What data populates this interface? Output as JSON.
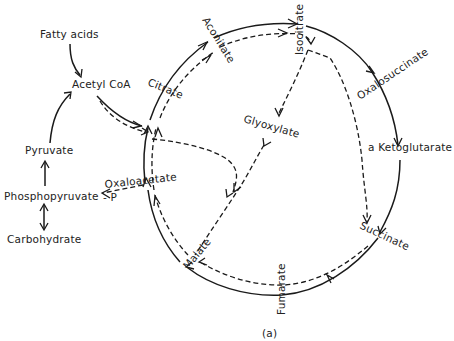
{
  "diagram": {
    "type": "metabolic-pathway",
    "caption": "(a)",
    "labels": {
      "fatty_acids": "Fatty acids",
      "acetyl_coa": "Acetyl CoA",
      "pyruvate": "Pyruvate",
      "phosphopyruvate": "Phosphopyruvate",
      "carbohydrate": "Carbohydrate",
      "oxaloacetate": "Oxaloacetate",
      "minus_p": "- P",
      "citrate": "Citrate",
      "aconitate": "Aconitate",
      "isocitrate": "Isocitrate",
      "oxalosuccinate": "Oxalosuccinate",
      "ketoglutarate": "a Ketoglutarate",
      "succinate": "Succinate",
      "fumarate": "Fumarate",
      "malate": "Malate",
      "glyoxylate": "Glyoxylate"
    },
    "pathways": {
      "solid": "Tricarboxylic acid (Krebs) cycle",
      "dashed": "Glyoxylate cycle"
    },
    "edges": [
      {
        "from": "Fatty acids",
        "to": "Acetyl CoA",
        "style": "solid"
      },
      {
        "from": "Pyruvate",
        "to": "Acetyl CoA",
        "style": "solid"
      },
      {
        "from": "Phosphopyruvate",
        "to": "Pyruvate",
        "style": "solid"
      },
      {
        "from": "Phosphopyruvate",
        "to": "Carbohydrate",
        "style": "solid",
        "bidirectional": true
      },
      {
        "from": "Acetyl CoA",
        "to": "Citrate",
        "style": "solid"
      },
      {
        "from": "Acetyl CoA",
        "to": "Citrate",
        "style": "dashed"
      },
      {
        "from": "Acetyl CoA",
        "to": "Malate",
        "style": "dashed"
      },
      {
        "from": "Oxaloacetate",
        "to": "Citrate",
        "style": "solid"
      },
      {
        "from": "Oxaloacetate",
        "to": "Citrate",
        "style": "dashed"
      },
      {
        "from": "Citrate",
        "to": "Aconitate",
        "style": "solid"
      },
      {
        "from": "Citrate",
        "to": "Aconitate",
        "style": "dashed"
      },
      {
        "from": "Aconitate",
        "to": "Isocitrate",
        "style": "solid"
      },
      {
        "from": "Aconitate",
        "to": "Isocitrate",
        "style": "dashed"
      },
      {
        "from": "Isocitrate",
        "to": "Oxalosuccinate",
        "style": "solid"
      },
      {
        "from": "Oxalosuccinate",
        "to": "a Ketoglutarate",
        "style": "solid"
      },
      {
        "from": "a Ketoglutarate",
        "to": "Succinate",
        "style": "solid"
      },
      {
        "from": "Isocitrate",
        "to": "Succinate",
        "style": "dashed"
      },
      {
        "from": "Isocitrate",
        "to": "Glyoxylate",
        "style": "dashed"
      },
      {
        "from": "Glyoxylate",
        "to": "Malate",
        "style": "dashed"
      },
      {
        "from": "Succinate",
        "to": "Fumarate",
        "style": "solid"
      },
      {
        "from": "Succinate",
        "to": "Fumarate",
        "style": "dashed"
      },
      {
        "from": "Fumarate",
        "to": "Malate",
        "style": "solid"
      },
      {
        "from": "Fumarate",
        "to": "Malate",
        "style": "dashed"
      },
      {
        "from": "Malate",
        "to": "Oxaloacetate",
        "style": "solid"
      },
      {
        "from": "Malate",
        "to": "Oxaloacetate",
        "style": "dashed"
      },
      {
        "from": "Oxaloacetate",
        "to": "Phosphopyruvate",
        "style": "dashed",
        "note": "- P"
      }
    ]
  }
}
